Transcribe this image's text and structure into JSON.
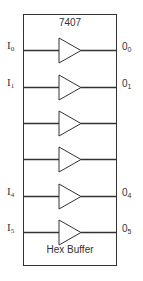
{
  "chip": {
    "part_number": "7407",
    "name": "Hex Buffer"
  },
  "colors": {
    "line": "#333333",
    "background": "#ffffff"
  },
  "buffers": [
    {
      "y": 50,
      "input": "I",
      "input_sub": "0",
      "output": "0",
      "output_sub": "0"
    },
    {
      "y": 87,
      "input": "I",
      "input_sub": "1",
      "output": "0",
      "output_sub": "1"
    },
    {
      "y": 123,
      "input": "",
      "input_sub": "",
      "output": "",
      "output_sub": ""
    },
    {
      "y": 159,
      "input": "",
      "input_sub": "",
      "output": "",
      "output_sub": ""
    },
    {
      "y": 196,
      "input": "I",
      "input_sub": "4",
      "output": "0",
      "output_sub": "4"
    },
    {
      "y": 232,
      "input": "I",
      "input_sub": "5",
      "output": "0",
      "output_sub": "5"
    }
  ]
}
